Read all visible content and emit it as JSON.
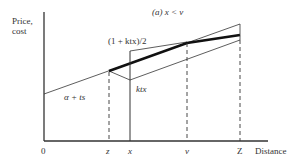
{
  "diagram": {
    "panel_title": "(a) x < v",
    "y_axis_label_line1": "Price,",
    "y_axis_label_line2": "cost",
    "x_axis_label": "Distance",
    "tick_labels": {
      "origin": "0",
      "z": "z",
      "x": "x",
      "v": "v",
      "Z": "Z"
    },
    "curve_labels": {
      "avg": "(1 + ktx)/2",
      "transport": "α + ts",
      "ktx": "ktx"
    },
    "colors": {
      "line": "#222222",
      "background": "#ffffff"
    }
  }
}
